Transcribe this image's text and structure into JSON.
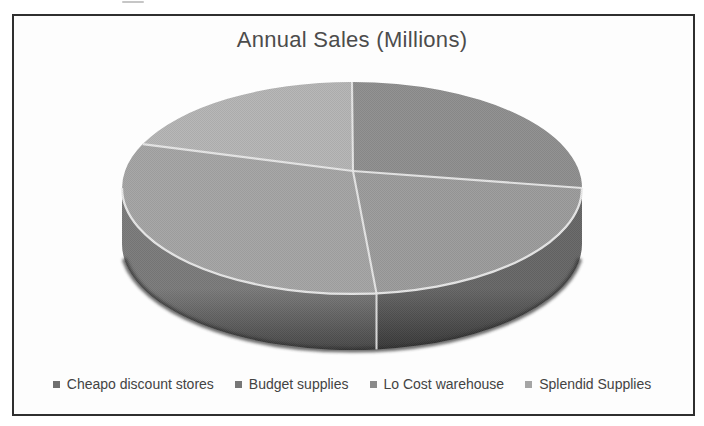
{
  "chart_data": {
    "type": "pie",
    "style": "3d",
    "title": "Annual Sales (Millions)",
    "legend_position": "bottom",
    "grid": false,
    "start_angle_deg": 0,
    "direction": "clockwise",
    "categories": [
      "Cheapo discount stores",
      "Budget supplies",
      "Lo Cost warehouse",
      "Splendid Supplies"
    ],
    "values_percent_estimated": [
      25.0,
      23.3,
      33.5,
      18.2
    ],
    "slices": [
      {
        "label": "Cheapo discount stores",
        "percent": 25.0,
        "top_color": "#8f8f8f",
        "side_color_top": "#6f6f6f",
        "side_color_bottom": "#404040",
        "marker_color": "#6f6f6f"
      },
      {
        "label": "Budget supplies",
        "percent": 23.3,
        "top_color": "#9c9c9c",
        "side_color_top": "#676767",
        "side_color_bottom": "#383838",
        "marker_color": "#777777"
      },
      {
        "label": "Lo Cost warehouse",
        "percent": 33.5,
        "top_color": "#a5a5a5",
        "side_color_top": "#7b7b7b",
        "side_color_bottom": "#474747",
        "marker_color": "#8a8a8a"
      },
      {
        "label": "Splendid Supplies",
        "percent": 18.2,
        "top_color": "#b5b5b5",
        "side_color_top": "#9a9a9a",
        "side_color_bottom": "#6f6f6f",
        "marker_color": "#a5a5a5"
      }
    ],
    "divider_line_color": "#ececec",
    "frame_border_color": "#2f2f2f",
    "title_color": "#4c4c4c",
    "legend_text_color": "#434343"
  }
}
